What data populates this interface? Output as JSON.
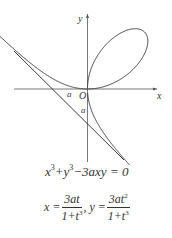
{
  "figure": {
    "axis_labels": {
      "x": "x",
      "y": "y",
      "origin": "O"
    },
    "intercept_labels": {
      "x_intercept": "a",
      "y_intercept": "a"
    },
    "curve": {
      "origin_px": [
        87.5,
        89
      ],
      "a_px": 38,
      "t_range_branch1": [
        -0.62,
        0
      ],
      "t_range_loop": [
        0,
        50
      ],
      "t_range_branch2": [
        -50,
        -1.55
      ],
      "stroke": "#3a3a3a"
    },
    "asymptote": {
      "equation": "x + y + a = 0",
      "from": [
        14,
        51
      ],
      "to": [
        124,
        160
      ],
      "stroke": "#3a3a3a"
    },
    "axes": {
      "x_from": 14,
      "x_to": 157,
      "y_from": 14,
      "y_to": 162,
      "stroke": "#555555"
    }
  },
  "equations": {
    "cartesian": {
      "lhs_terms": [
        "x",
        "3",
        "+y",
        "3",
        "−3axy = 0"
      ]
    },
    "parametric": {
      "x_label": "x =",
      "x_num": "3at",
      "x_den": "1+t",
      "x_den_exp": "3",
      "sep": ", y =",
      "y_num": "3at",
      "y_num_exp": "2",
      "y_den": "1+t",
      "y_den_exp": "3"
    }
  }
}
